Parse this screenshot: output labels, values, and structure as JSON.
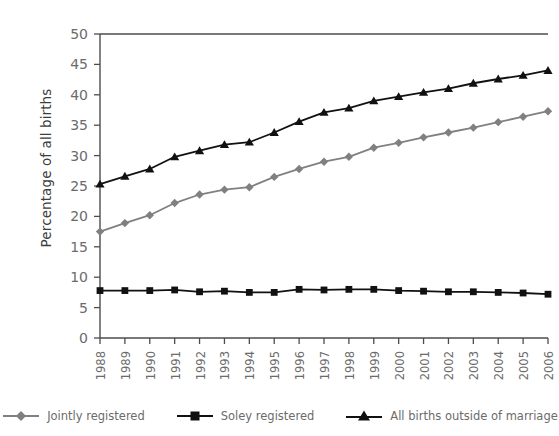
{
  "chart_data": {
    "type": "line",
    "title": "",
    "xlabel": "",
    "ylabel": "Percentage of all births",
    "ylim": [
      0,
      50
    ],
    "yticks": [
      0,
      5,
      10,
      15,
      20,
      25,
      30,
      35,
      40,
      45,
      50
    ],
    "grid": false,
    "legend_position": "bottom",
    "categories": [
      "1988",
      "1989",
      "1990",
      "1991",
      "1992",
      "1993",
      "1994",
      "1995",
      "1996",
      "1997",
      "1998",
      "1999",
      "2000",
      "2001",
      "2002",
      "2003",
      "2004",
      "2005",
      "2006"
    ],
    "series": [
      {
        "name": "Jointly registered",
        "color": "#808080",
        "marker": "diamond",
        "values": [
          17.5,
          18.9,
          20.2,
          22.2,
          23.6,
          24.4,
          24.8,
          26.5,
          27.8,
          29.0,
          29.8,
          31.3,
          32.1,
          33.0,
          33.8,
          34.6,
          35.5,
          36.4,
          37.3
        ]
      },
      {
        "name": "Soley registered",
        "color": "#111111",
        "marker": "square",
        "values": [
          7.8,
          7.8,
          7.8,
          7.9,
          7.6,
          7.7,
          7.5,
          7.5,
          8.0,
          7.9,
          8.0,
          8.0,
          7.8,
          7.7,
          7.6,
          7.6,
          7.5,
          7.4,
          7.2
        ]
      },
      {
        "name": "All births outside of marriage",
        "color": "#111111",
        "marker": "triangle",
        "values": [
          25.3,
          26.6,
          27.8,
          29.8,
          30.8,
          31.8,
          32.2,
          33.8,
          35.6,
          37.1,
          37.8,
          39.0,
          39.7,
          40.4,
          41.0,
          41.9,
          42.6,
          43.2,
          44.0
        ]
      }
    ]
  },
  "axes": {
    "y_title": "Percentage of all births"
  },
  "legend": {
    "items": [
      {
        "label": "Jointly registered"
      },
      {
        "label": "Soley registered"
      },
      {
        "label": "All births outside of marriage"
      }
    ]
  },
  "colors": {
    "jointly": "#808080",
    "soley": "#111111",
    "all_births": "#111111",
    "axis": "#4d4d4d",
    "tick_text": "#6b6b6b"
  }
}
